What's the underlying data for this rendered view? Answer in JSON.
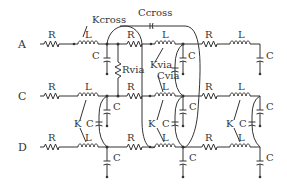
{
  "diagram": {
    "type": "transmission-line circuit schematic",
    "rows": [
      {
        "label": "A",
        "y": 44
      },
      {
        "label": "C",
        "y": 96
      },
      {
        "label": "D",
        "y": 147
      }
    ],
    "component_labels": {
      "resistor": "R",
      "inductor": "L",
      "capacitor": "C",
      "mutual_coupling": "K",
      "kcross": "Kcross",
      "ccross": "Ccross",
      "rvia": "Rvia",
      "kvia": "Kvia",
      "cvia": "Cvia"
    },
    "colors": {
      "stroke": "#333333",
      "background": "#ffffff"
    }
  }
}
